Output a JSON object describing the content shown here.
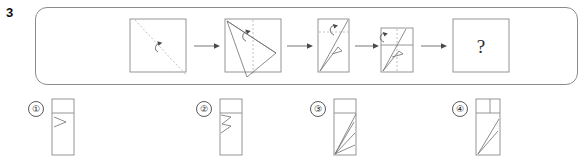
{
  "question": {
    "number": "3",
    "type": "paper-folding-sequence",
    "unknown_marker": "?"
  },
  "stem": {
    "panels": [
      {
        "id": "panel-1",
        "name": "square-with-diagonal-fold-line",
        "shape": "square",
        "fold_line": "dashed-diagonal-top-left-to-bottom-right",
        "rotation_arrow": "counter-clockwise-curved-arrow"
      },
      {
        "id": "panel-2",
        "name": "folded-triangle-shape",
        "shape": "square-with-folded-triangle",
        "fold_line": "dashed-vertical-center",
        "rotation_arrow": "counter-clockwise-curved-arrow"
      },
      {
        "id": "panel-3",
        "name": "narrow-rectangle-with-diagonals",
        "shape": "tall-narrow-rectangle",
        "fold_line": "dashed-horizontal-upper",
        "rotation_arrow": "counter-clockwise-curved-arrow"
      },
      {
        "id": "panel-4",
        "name": "small-square-with-diagonal",
        "shape": "small-square",
        "fold_line": "dashed-vertical-center",
        "rotation_arrow": "counter-clockwise-curved-arrow"
      },
      {
        "id": "panel-5",
        "name": "answer-placeholder-panel",
        "shape": "square",
        "content": "?"
      }
    ],
    "arrows": [
      {
        "name": "arrow-1",
        "direction": "right"
      },
      {
        "name": "arrow-2",
        "direction": "right"
      },
      {
        "name": "arrow-3",
        "direction": "right"
      },
      {
        "name": "arrow-4",
        "direction": "right"
      }
    ]
  },
  "options": [
    {
      "label": "①",
      "name": "option-1",
      "description": "tall rectangle, horizontal line near top, small arrowhead shape at left"
    },
    {
      "label": "②",
      "name": "option-2",
      "description": "tall rectangle, horizontal line near top, zigzag shape below at left"
    },
    {
      "label": "③",
      "name": "option-3",
      "description": "tall rectangle, horizontal line near top, fan of diagonals from bottom-left"
    },
    {
      "label": "④",
      "name": "option-4",
      "description": "tall rectangle, horizontal line near top with vertical divider, two diagonals from bottom-left"
    }
  ],
  "colors": {
    "ink": "#5e5e5e",
    "dashed": "#b9b9b9",
    "border": "#8b8b8b",
    "text": "#111111"
  }
}
